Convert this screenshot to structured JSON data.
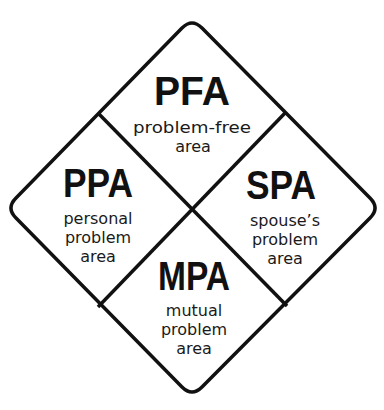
{
  "diagram": {
    "title": "",
    "colors": {
      "stroke": "#111111",
      "text": "#111111",
      "background": "#ffffff"
    },
    "quadrants": [
      {
        "id": "pfa",
        "position": "top",
        "abbr": "PFA",
        "lines": [
          "problem-free",
          "area"
        ]
      },
      {
        "id": "ppa",
        "position": "left",
        "abbr": "PPA",
        "lines": [
          "personal",
          "problem",
          "area"
        ]
      },
      {
        "id": "spa",
        "position": "right",
        "abbr": "SPA",
        "lines": [
          "spouse’s",
          "problem",
          "area"
        ]
      },
      {
        "id": "mpa",
        "position": "bottom",
        "abbr": "MPA",
        "lines": [
          "mutual",
          "problem",
          "area"
        ]
      }
    ]
  }
}
